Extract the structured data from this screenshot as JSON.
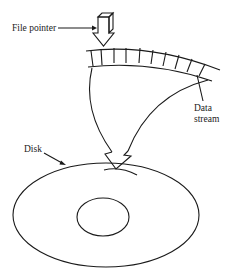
{
  "diagram": {
    "labels": {
      "file_pointer": "File pointer",
      "data_stream_line1": "Data",
      "data_stream_line2": "stream",
      "disk": "Disk"
    },
    "colors": {
      "stroke": "#1a1a1a",
      "text": "#222222",
      "background": "#ffffff"
    }
  }
}
